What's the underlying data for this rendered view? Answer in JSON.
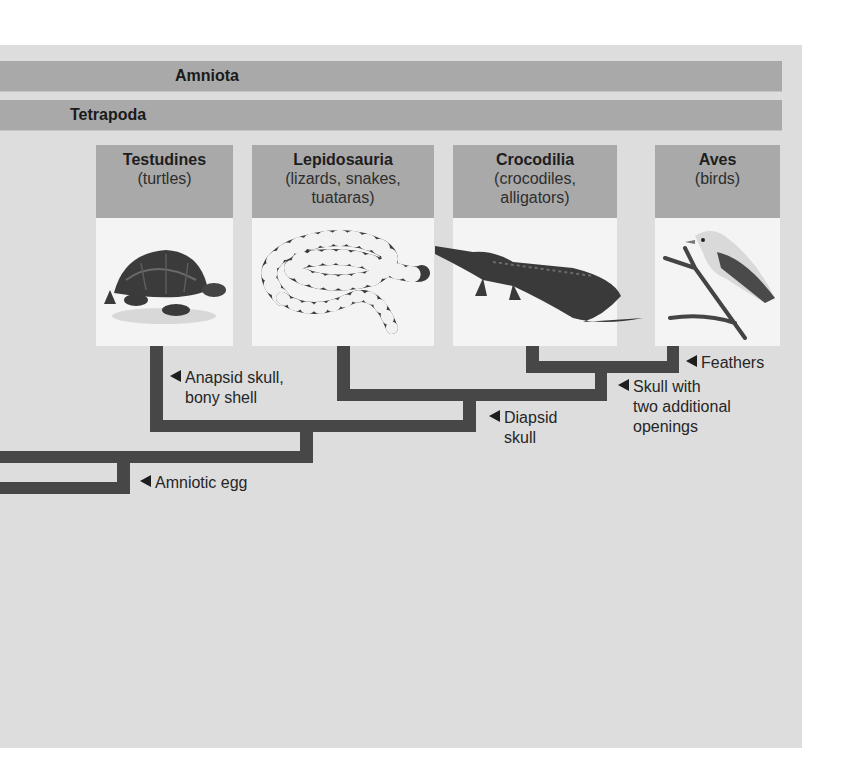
{
  "bands": [
    {
      "label": "Amniota"
    },
    {
      "label": "Tetrapoda"
    }
  ],
  "taxa": [
    {
      "name": "Testudines",
      "common": "(turtles)",
      "icon": "turtle-icon"
    },
    {
      "name": "Lepidosauria",
      "common": "(lizards, snakes,\ntuataras)",
      "icon": "snake-icon"
    },
    {
      "name": "Crocodilia",
      "common": "(crocodiles,\nalligators)",
      "icon": "alligator-icon"
    },
    {
      "name": "Aves",
      "common": "(birds)",
      "icon": "bird-icon"
    }
  ],
  "traits": [
    {
      "label": "Anapsid skull,\nbony shell"
    },
    {
      "label": "Amniotic egg"
    },
    {
      "label": "Diapsid\nskull"
    },
    {
      "label": "Skull with\ntwo additional\nopenings"
    },
    {
      "label": "Feathers"
    }
  ],
  "colors": {
    "background_panel": "#dddddd",
    "band": "#a9a9a9",
    "branch_line": "#474747",
    "image_bg": "#f4f4f4"
  }
}
